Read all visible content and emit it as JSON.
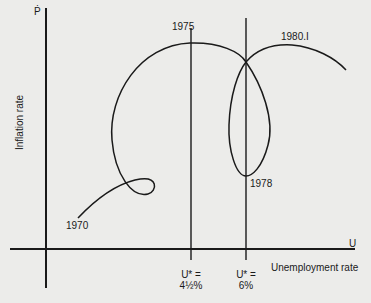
{
  "figure": {
    "y_axis_symbol": "Ṗ",
    "y_axis_label": "Inflation rate",
    "x_axis_symbol": "U",
    "x_axis_label": "Unemployment rate",
    "vertical_lines": [
      {
        "label_line1": "U* =",
        "label_line2": "4½%"
      },
      {
        "label_line1": "U* =",
        "label_line2": "6%"
      }
    ],
    "point_labels": {
      "start": "1970",
      "peak": "1975",
      "loop_bottom": "1978",
      "end": "1980.I"
    },
    "colors": {
      "background": "#ececea",
      "ink": "#1a1a1a"
    }
  }
}
